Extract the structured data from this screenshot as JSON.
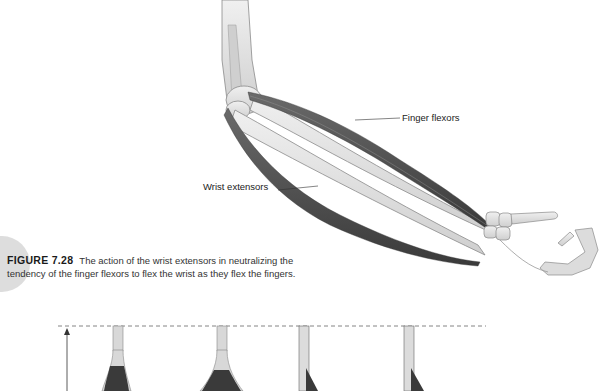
{
  "figure": {
    "number": "FIGURE 7.28",
    "caption": "The action of the wrist extensors in neutralizing the tendency of the finger flexors to flex the wrist as they flex the fingers.",
    "labels": {
      "finger_flexors": "Finger flexors",
      "wrist_extensors": "Wrist extensors"
    }
  },
  "lower_diagram": {
    "muscle_shapes": [
      {
        "type": "fusiform",
        "x": 118
      },
      {
        "type": "fusiform",
        "x": 222
      },
      {
        "type": "unipennate",
        "x": 305
      },
      {
        "type": "unipennate",
        "x": 411
      }
    ]
  },
  "colors": {
    "bone": "#e2e2e2",
    "bone_outline": "#8a8a8a",
    "muscle": "#4a4a4a",
    "text": "#333333",
    "accent_circle": "#d9d9d9"
  }
}
